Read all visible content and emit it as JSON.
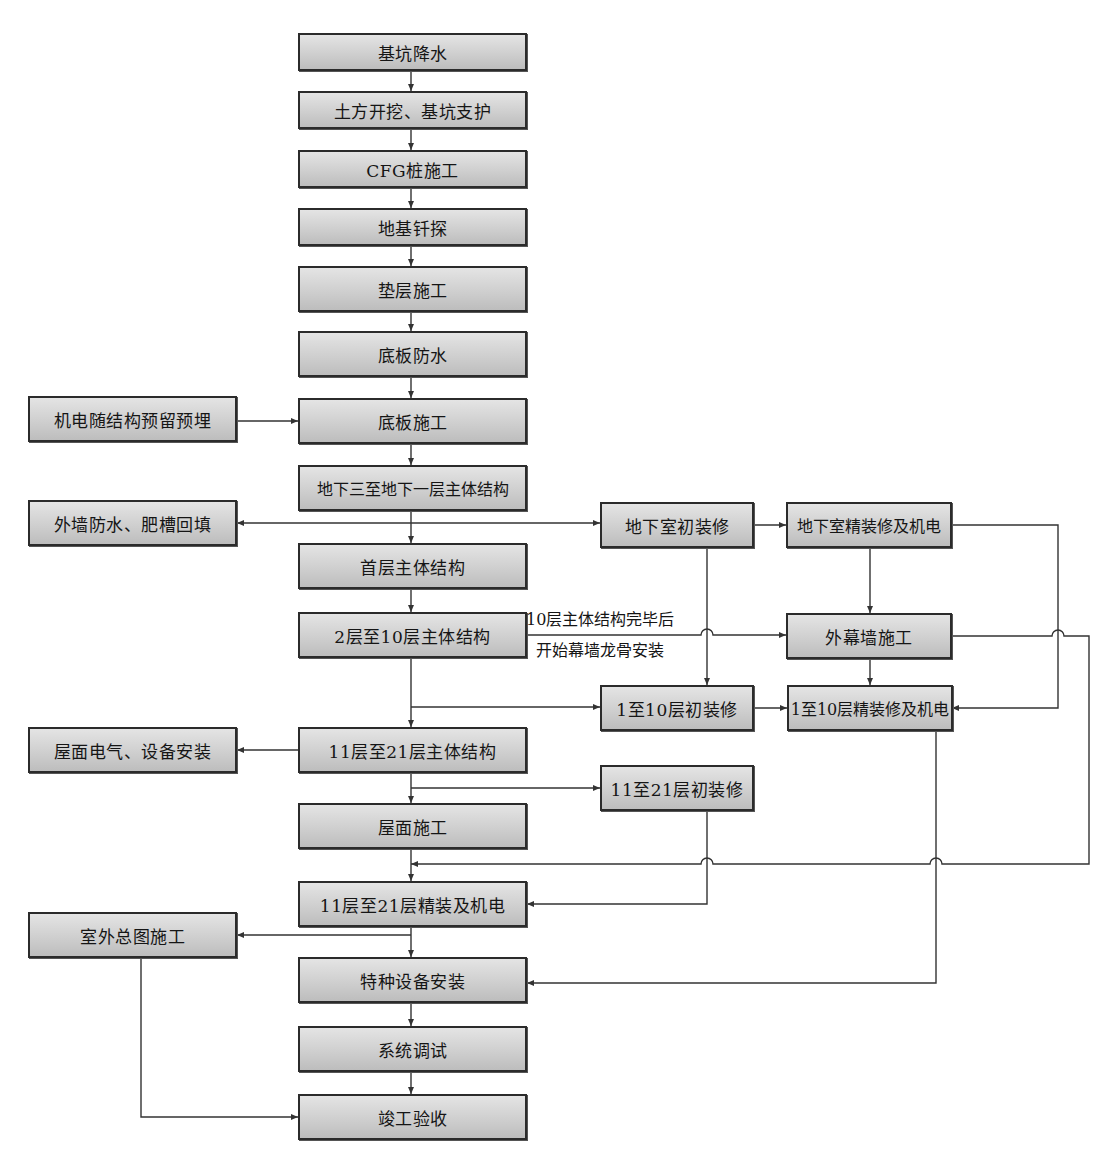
{
  "diagram": {
    "type": "construction-process-flowchart",
    "nodes": {
      "n01": "基坑降水",
      "n02": "土方开挖、基坑支护",
      "n03": "CFG桩施工",
      "n04": "地基钎探",
      "n05": "垫层施工",
      "n06": "底板防水",
      "n07": "底板施工",
      "n08": "地下三至地下一层主体结构",
      "n09": "首层主体结构",
      "n10": "2层至10层主体结构",
      "n11": "11层至21层主体结构",
      "n12": "屋面施工",
      "n13": "11层至21层精装及机电",
      "n14": "特种设备安装",
      "n15": "系统调试",
      "n16": "竣工验收",
      "l01": "机电随结构预留预埋",
      "l02": "外墙防水、肥槽回填",
      "l03": "屋面电气、设备安装",
      "l04": "室外总图施工",
      "m01": "地下室初装修",
      "m02": "1至10层初装修",
      "m03": "11至21层初装修",
      "r01": "地下室精装修及机电",
      "r02": "外幕墙施工",
      "r03": "1至10层精装修及机电"
    },
    "annotation": {
      "line1": "10层主体结构完毕后",
      "line2": "开始幕墙龙骨安装"
    },
    "edges": [
      [
        "n01",
        "n02"
      ],
      [
        "n02",
        "n03"
      ],
      [
        "n03",
        "n04"
      ],
      [
        "n04",
        "n05"
      ],
      [
        "n05",
        "n06"
      ],
      [
        "n06",
        "n07"
      ],
      [
        "l01",
        "n07"
      ],
      [
        "n07",
        "n08"
      ],
      [
        "n08",
        "n09"
      ],
      [
        "n08",
        "l02"
      ],
      [
        "n08",
        "m01"
      ],
      [
        "n09",
        "n10"
      ],
      [
        "n10",
        "r02"
      ],
      [
        "n10",
        "n11"
      ],
      [
        "n10",
        "m02"
      ],
      [
        "m01",
        "r01"
      ],
      [
        "m01",
        "m02"
      ],
      [
        "r01",
        "r02"
      ],
      [
        "r01",
        "r03"
      ],
      [
        "r02",
        "r03"
      ],
      [
        "m02",
        "r03"
      ],
      [
        "n11",
        "l03"
      ],
      [
        "n11",
        "n12"
      ],
      [
        "n11",
        "m03"
      ],
      [
        "n12",
        "n13"
      ],
      [
        "r02",
        "n13"
      ],
      [
        "m03",
        "n13"
      ],
      [
        "n13",
        "n14"
      ],
      [
        "n13",
        "l04"
      ],
      [
        "r03",
        "n14"
      ],
      [
        "n14",
        "n15"
      ],
      [
        "n15",
        "n16"
      ],
      [
        "l04",
        "n16"
      ]
    ]
  }
}
